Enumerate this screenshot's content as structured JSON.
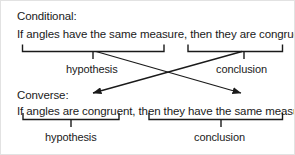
{
  "figure": {
    "ink_color": "#1a1a1a",
    "background_color": "#ffffff",
    "width": 295,
    "height": 155
  },
  "conditional": {
    "heading": "Conditional:",
    "statement": "If angles have the same measure, then they are congruent.",
    "hypothesis_label": "hypothesis",
    "conclusion_label": "conclusion"
  },
  "converse": {
    "heading": "Converse:",
    "statement": "If angles are congruent, then they have the same measure.",
    "hypothesis_label": "hypothesis",
    "conclusion_label": "conclusion"
  },
  "annotations": {
    "arrow_hypothesis_to_conclusion": "hypothesis of conditional becomes conclusion of converse",
    "arrow_conclusion_to_hypothesis": "conclusion of conditional becomes hypothesis of converse"
  }
}
